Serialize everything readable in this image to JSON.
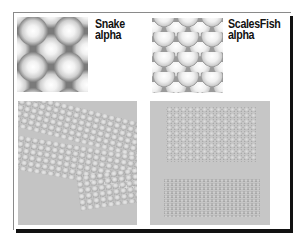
{
  "figure": {
    "panels": [
      {
        "label_line1": "Snake",
        "label_line2": "alpha",
        "texture": "snake-alpha-map"
      },
      {
        "label_line1": "ScalesFish",
        "label_line2": "alpha",
        "texture": "fish-scales-alpha-map"
      }
    ],
    "renders": [
      {
        "texture": "snake-skin-relief-render"
      },
      {
        "texture": "fish-scales-relief-render"
      }
    ],
    "colors": {
      "frame_border": "#8a8a8a",
      "frame_shadow": "#111111",
      "render_background": "#c4c4c4",
      "label_text": "#111111"
    }
  }
}
